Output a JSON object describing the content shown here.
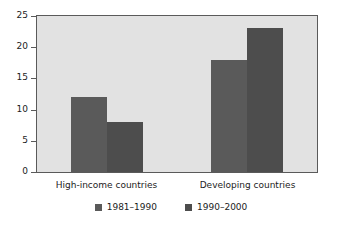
{
  "chart_data": {
    "type": "bar",
    "title": "",
    "subtitle": "",
    "xlabel": "",
    "ylabel": "",
    "categories": [
      "High-income countries",
      "Developing countries"
    ],
    "series": [
      {
        "name": "1981–1990",
        "values": [
          12,
          18
        ],
        "color": "#5a5a5a"
      },
      {
        "name": "1990–2000",
        "values": [
          8,
          23
        ],
        "color": "#4d4d4d"
      }
    ],
    "ylim": [
      0,
      25
    ],
    "ytick_step": 5,
    "yticks": [
      0,
      5,
      10,
      15,
      20,
      25
    ],
    "ytick_labels": [
      "0",
      "5",
      "10",
      "15",
      "20",
      "25"
    ],
    "grid": false,
    "legend_position": "bottom",
    "plot_background": "#e2e2e2",
    "frame_color": "#5a5a5a",
    "page_background": "#ffffff",
    "annotations": []
  }
}
